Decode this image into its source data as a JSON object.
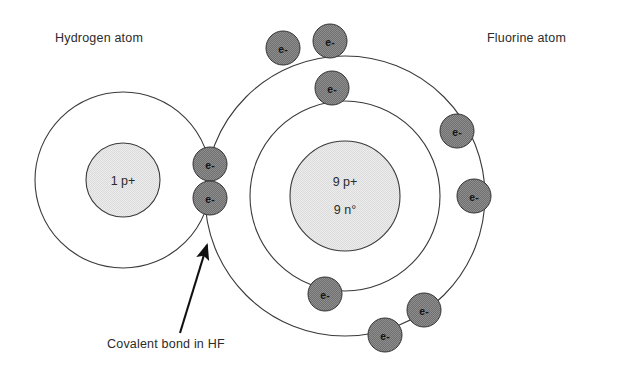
{
  "diagram": {
    "title": "Covalent bond in HF",
    "type": "bohr-model-atomic-diagram",
    "background_color": "#ffffff",
    "stroke_color": "#3a3a3a",
    "electron_fill": "#7b7b7b",
    "nucleus_fill": "#e9e9e9",
    "text_color": "#2b2b2b"
  },
  "labels": {
    "hydrogen_atom": "Hydrogen atom",
    "fluorine_atom": "Fluorine atom",
    "covalent_bond": "Covalent bond in HF"
  },
  "hydrogen": {
    "name": "Hydrogen atom",
    "nucleus_label": "1 p+",
    "protons": "1 p+",
    "center": {
      "x": 123,
      "y": 180
    },
    "nucleus_radius": 37,
    "shells": [
      {
        "index": 1,
        "radius": 88,
        "electron_count": 1
      }
    ]
  },
  "fluorine": {
    "name": "Fluorine atom",
    "nucleus_label_protons": "9 p+",
    "nucleus_label_neutrons": "9 n°",
    "center": {
      "x": 345,
      "y": 196
    },
    "nucleus_radius": 55,
    "shells": [
      {
        "index": 1,
        "radius": 95,
        "electron_count": 2
      },
      {
        "index": 2,
        "radius": 140,
        "electron_count": 8
      }
    ]
  },
  "electron_label": "e-",
  "electron_radius": 17,
  "electrons": [
    {
      "id": "f-inner-top",
      "label": "e-",
      "x": 332,
      "y": 88,
      "shell": "fluorine-inner",
      "shared": false
    },
    {
      "id": "f-inner-bottom",
      "label": "e-",
      "x": 325,
      "y": 294,
      "shell": "fluorine-inner",
      "shared": false
    },
    {
      "id": "f-outer-1",
      "label": "e-",
      "x": 283,
      "y": 48,
      "shell": "fluorine-outer",
      "shared": false
    },
    {
      "id": "f-outer-2",
      "label": "e-",
      "x": 330,
      "y": 41,
      "shell": "fluorine-outer",
      "shared": false
    },
    {
      "id": "f-outer-3",
      "label": "e-",
      "x": 457,
      "y": 131,
      "shell": "fluorine-outer",
      "shared": false
    },
    {
      "id": "f-outer-4",
      "label": "e-",
      "x": 474,
      "y": 196,
      "shell": "fluorine-outer",
      "shared": false
    },
    {
      "id": "f-outer-5",
      "label": "e-",
      "x": 424,
      "y": 310,
      "shell": "fluorine-outer",
      "shared": false
    },
    {
      "id": "f-outer-6",
      "label": "e-",
      "x": 385,
      "y": 335,
      "shell": "fluorine-outer",
      "shared": false
    },
    {
      "id": "bond-upper",
      "label": "e-",
      "x": 210,
      "y": 164,
      "shell": "shared-bond",
      "shared": true
    },
    {
      "id": "bond-lower",
      "label": "e-",
      "x": 210,
      "y": 198,
      "shell": "shared-bond",
      "shared": true
    }
  ],
  "annotation": {
    "text": "Covalent bond in HF",
    "arrow_from": {
      "x": 180,
      "y": 333
    },
    "arrow_to": {
      "x": 207,
      "y": 242
    }
  }
}
